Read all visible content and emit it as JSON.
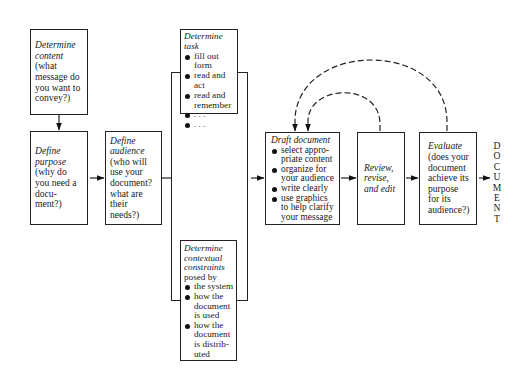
{
  "diagram": {
    "colors": {
      "line": "#222222",
      "background": "#ffffff"
    },
    "nodes": {
      "determine_content": {
        "title": "Determine content",
        "text": "(what message do you want to convey?)"
      },
      "define_purpose": {
        "title": "Define purpose",
        "text": "(why do you need a docu-ment?)"
      },
      "define_audience": {
        "title": "Define audience",
        "text": "(who will use your document? what are their needs?)"
      },
      "determine_task": {
        "title": "Determine task",
        "items": [
          "fill out form",
          "read and act",
          "read and remember",
          ". . .",
          ". . ."
        ]
      },
      "determine_constraints": {
        "title": "Determine contextual constraints",
        "text": "posed by",
        "items": [
          "the system",
          "how the document is used",
          "how the document is distrib-uted"
        ]
      },
      "draft_document": {
        "title": "Draft document",
        "items": [
          "select appro-priate content",
          "organize for your audience",
          "write clearly",
          "use graphics to help clarify your message"
        ]
      },
      "review": {
        "title": "Review, revise, and edit"
      },
      "evaluate": {
        "title": "Evaluate",
        "text": "(does your document achieve its purpose for its audience?)"
      }
    },
    "output_label": [
      "D",
      "O",
      "C",
      "U",
      "M",
      "E",
      "N",
      "T"
    ],
    "edges": [
      {
        "from": "determine_content",
        "to": "define_purpose",
        "style": "solid"
      },
      {
        "from": "define_purpose",
        "to": "define_audience",
        "style": "solid"
      },
      {
        "from": "define_audience",
        "to": "task_constraints_group",
        "style": "solid"
      },
      {
        "from": "task_constraints_group",
        "to": "draft_document",
        "style": "solid"
      },
      {
        "from": "draft_document",
        "to": "review",
        "style": "solid"
      },
      {
        "from": "review",
        "to": "evaluate",
        "style": "solid"
      },
      {
        "from": "evaluate",
        "to": "DOCUMENT",
        "style": "solid"
      },
      {
        "from": "review",
        "to": "draft_document",
        "style": "dashed"
      },
      {
        "from": "evaluate",
        "to": "draft_document",
        "style": "dashed"
      }
    ]
  }
}
